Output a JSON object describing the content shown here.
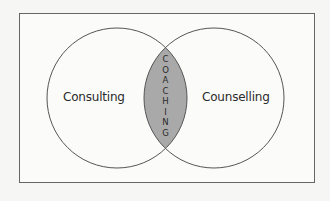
{
  "diagram": {
    "type": "venn",
    "frame": {
      "stroke": "#666666",
      "background": "#fbfbfa"
    },
    "circles": [
      {
        "id": "left",
        "label": "Consulting",
        "cx": 117,
        "cy": 98,
        "r": 70
      },
      {
        "id": "right",
        "label": "Counselling",
        "cx": 214,
        "cy": 98,
        "r": 70
      }
    ],
    "intersection": {
      "label": "COACHING",
      "letters": [
        "C",
        "O",
        "A",
        "C",
        "H",
        "I",
        "N",
        "G"
      ],
      "fill": "#a9a9a9"
    },
    "colors": {
      "line": "#555555",
      "text": "#2a2a2a",
      "background": "#f6f6f4"
    }
  }
}
